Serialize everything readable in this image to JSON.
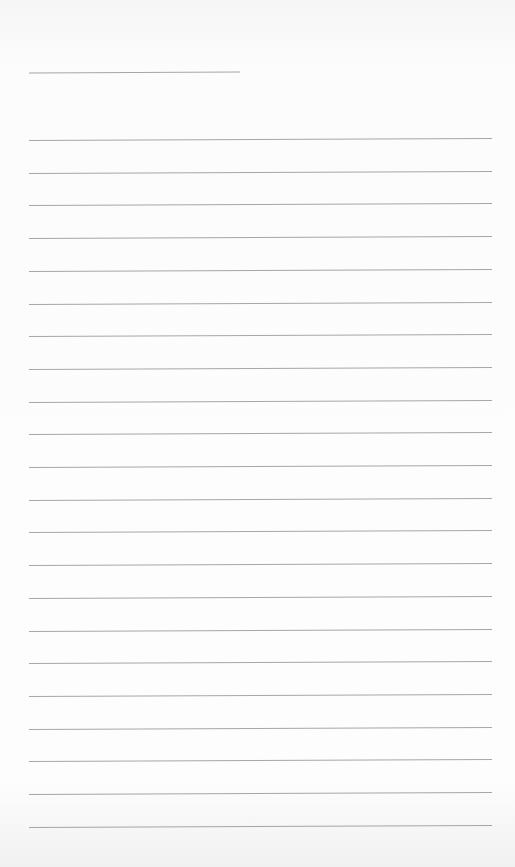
{
  "page": {
    "type": "blank lined paper",
    "name_line_count": 1,
    "ruled_line_count": 22
  },
  "lines": {
    "first_y": 139,
    "spacing": 32.7,
    "left": 29,
    "right": 492,
    "color": "#8a8a8a"
  }
}
